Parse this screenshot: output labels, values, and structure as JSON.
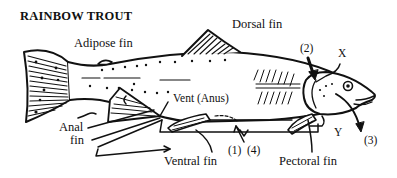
{
  "title": "RAINBOW TROUT",
  "labels": {
    "adipose_fin": "Adipose fin",
    "dorsal_fin": "Dorsal fin",
    "vent": "Vent (Anus)",
    "anal_fin_line1": "Anal",
    "anal_fin_line2": "fin",
    "ventral_fin": "Ventral fin",
    "pectoral_fin": "Pectoral fin",
    "marker_1": "(1)",
    "marker_2": "(2)",
    "marker_3": "(3)",
    "marker_4": "(4)",
    "marker_x": "X",
    "marker_y": "Y"
  },
  "colors": {
    "ink": "#111111",
    "background": "#ffffff"
  }
}
